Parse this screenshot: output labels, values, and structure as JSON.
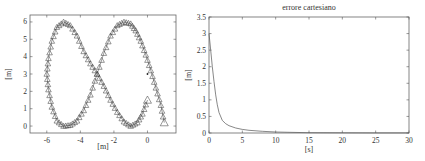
{
  "chart_data": [
    {
      "type": "line",
      "title": "",
      "xlabel": "[m]",
      "ylabel": "[m]",
      "xlim": [
        -7,
        1.7
      ],
      "ylim": [
        -0.4,
        6.4
      ],
      "xticks": [
        -6,
        -4,
        -2,
        0
      ],
      "yticks": [
        0,
        1,
        2,
        3,
        4,
        5,
        6
      ],
      "grid": false,
      "legend": null,
      "marker": "triangle",
      "description": "Figure-eight trajectory with triangle markers; crossing at (-3, 3); left lobe extremes around x=-6, right lobe reaches x=1; start/end markers near (1, 0.2) and (0, 1.5); isolated point at (0, 3)",
      "series": [
        {
          "name": "trajectory",
          "x": [
            1.0,
            0.8,
            0.5,
            0.2,
            -0.1,
            -0.4,
            -0.7,
            -1.0,
            -1.4,
            -1.8,
            -2.2,
            -2.6,
            -3.0,
            -3.4,
            -3.8,
            -4.2,
            -4.6,
            -5.0,
            -5.4,
            -5.7,
            -5.9,
            -6.0,
            -5.9,
            -5.7,
            -5.4,
            -5.0,
            -4.6,
            -4.2,
            -3.8,
            -3.4,
            -3.0,
            -2.6,
            -2.2,
            -1.8,
            -1.4,
            -1.0,
            -0.6,
            -0.3,
            0.0
          ],
          "y": [
            0.2,
            1.2,
            2.2,
            3.2,
            4.1,
            4.9,
            5.5,
            5.9,
            6.0,
            5.8,
            5.2,
            4.2,
            3.0,
            1.8,
            0.9,
            0.3,
            0.05,
            0.0,
            0.3,
            1.1,
            2.1,
            3.0,
            3.9,
            4.9,
            5.7,
            6.0,
            5.8,
            5.2,
            4.3,
            3.6,
            3.0,
            2.3,
            1.5,
            0.8,
            0.25,
            0.0,
            0.2,
            0.7,
            1.5
          ]
        },
        {
          "name": "target-point",
          "x": [
            0.0
          ],
          "y": [
            3.0
          ]
        }
      ]
    },
    {
      "type": "line",
      "title": "errore cartesiano",
      "xlabel": "[s]",
      "ylabel": "[m]",
      "xlim": [
        0,
        30
      ],
      "ylim": [
        0,
        3.5
      ],
      "xticks": [
        0,
        5,
        10,
        15,
        20,
        25,
        30
      ],
      "yticks": [
        0,
        0.5,
        1,
        1.5,
        2,
        2.5,
        3,
        3.5
      ],
      "grid": false,
      "legend": null,
      "series": [
        {
          "name": "cartesian error",
          "x": [
            0,
            0.25,
            0.5,
            0.75,
            1,
            1.25,
            1.5,
            2,
            2.5,
            3,
            4,
            5,
            6,
            8,
            10,
            12,
            15,
            20,
            25,
            30
          ],
          "y": [
            3.0,
            2.5,
            2.0,
            1.55,
            1.15,
            0.85,
            0.62,
            0.38,
            0.28,
            0.22,
            0.15,
            0.11,
            0.08,
            0.05,
            0.03,
            0.02,
            0.01,
            0.005,
            0.003,
            0.002
          ]
        }
      ]
    }
  ],
  "plots": {
    "left": {
      "xlabel": "[m]",
      "ylabel": "[m]",
      "xtick_labels": [
        "-6",
        "-4",
        "-2",
        "0"
      ],
      "ytick_labels": [
        "0",
        "1",
        "2",
        "3",
        "4",
        "5",
        "6"
      ]
    },
    "right": {
      "title": "errore cartesiano",
      "xlabel": "[s]",
      "ylabel": "[m]",
      "xtick_labels": [
        "0",
        "5",
        "10",
        "15",
        "20",
        "25",
        "30"
      ],
      "ytick_labels": [
        "0",
        "0.5",
        "1",
        "1.5",
        "2",
        "2.5",
        "3",
        "3.5"
      ]
    }
  },
  "colors": {
    "axes": "#555555",
    "line": "#555555",
    "marker": "#444444"
  }
}
